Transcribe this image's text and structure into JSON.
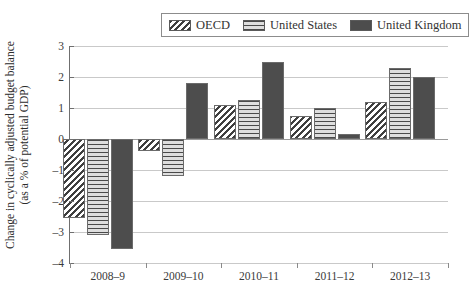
{
  "chart_data": {
    "type": "bar",
    "title": "",
    "xlabel": "",
    "ylabel": "Change in cyclically adjusted budget balance (as a % of potential GDP)",
    "ylabel_line1": "Change in cyclically adjusted budget balance",
    "ylabel_line2": "(as a % of potential GDP)",
    "categories": [
      "2008–9",
      "2009–10",
      "2010–11",
      "2011–12",
      "2012–13"
    ],
    "series": [
      {
        "name": "OECD",
        "values": [
          -2.55,
          -0.4,
          1.1,
          0.75,
          1.2
        ],
        "pattern": "diagonal-stripes",
        "color": "#3f3f3f"
      },
      {
        "name": "United States",
        "values": [
          -3.1,
          -1.2,
          1.25,
          1.0,
          2.3
        ],
        "pattern": "horizontal-stripes",
        "color": "#4a4a4a"
      },
      {
        "name": "United Kingdom",
        "values": [
          -3.55,
          1.8,
          2.5,
          0.15,
          2.0
        ],
        "pattern": "solid",
        "color": "#4d4d4d"
      }
    ],
    "ylim": [
      -4,
      3
    ],
    "yticks": [
      3,
      2,
      1,
      0,
      -1,
      -2,
      -3,
      -4
    ],
    "ytick_labels": [
      "3",
      "2",
      "1",
      "0",
      "–1",
      "–2",
      "–3",
      "–4"
    ],
    "grid": true,
    "legend_position": "top-right"
  },
  "legend": {
    "entries": [
      {
        "label": "OECD",
        "swatch": "diagonal-stripes-swatch"
      },
      {
        "label": "United States",
        "swatch": "horizontal-stripes-swatch"
      },
      {
        "label": "United Kingdom",
        "swatch": "solid-dark-swatch"
      }
    ]
  }
}
